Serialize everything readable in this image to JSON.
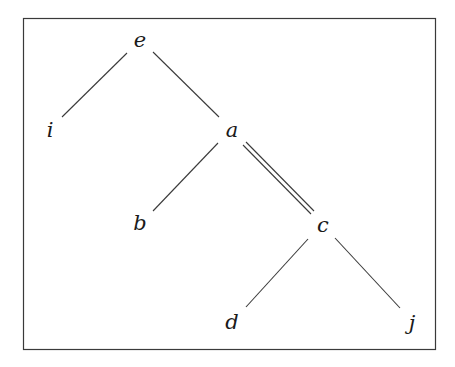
{
  "diagram": {
    "type": "tree",
    "nodes": [
      {
        "id": "e",
        "label": "e",
        "x": 140,
        "y": 40
      },
      {
        "id": "i",
        "label": "i",
        "x": 50,
        "y": 130
      },
      {
        "id": "a",
        "label": "a",
        "x": 232,
        "y": 130
      },
      {
        "id": "b",
        "label": "b",
        "x": 140,
        "y": 223
      },
      {
        "id": "c",
        "label": "c",
        "x": 323,
        "y": 225
      },
      {
        "id": "d",
        "label": "d",
        "x": 232,
        "y": 322
      },
      {
        "id": "j",
        "label": "j",
        "x": 412,
        "y": 323
      }
    ],
    "edges": [
      {
        "from": "e",
        "to": "i",
        "style": "single"
      },
      {
        "from": "e",
        "to": "a",
        "style": "single"
      },
      {
        "from": "a",
        "to": "b",
        "style": "single"
      },
      {
        "from": "a",
        "to": "c",
        "style": "double"
      },
      {
        "from": "c",
        "to": "d",
        "style": "single"
      },
      {
        "from": "c",
        "to": "j",
        "style": "single"
      }
    ]
  }
}
